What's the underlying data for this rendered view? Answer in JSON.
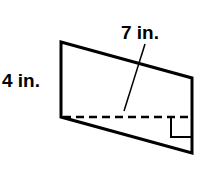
{
  "figure": {
    "shape": "parallelogram",
    "labels": {
      "side": "4 in.",
      "height": "7 in."
    },
    "colors": {
      "stroke": "#000000",
      "background": "#ffffff"
    }
  }
}
